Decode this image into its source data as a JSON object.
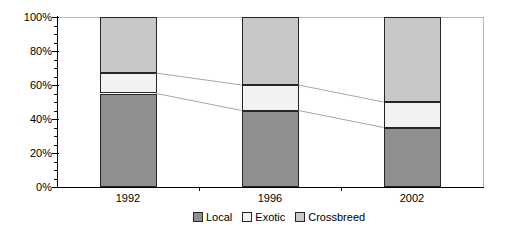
{
  "chart_data": {
    "type": "bar",
    "subtype": "stacked-100-percent",
    "title": "",
    "xlabel": "",
    "ylabel": "",
    "categories": [
      "1992",
      "1996",
      "2002"
    ],
    "series": [
      {
        "name": "Local",
        "values": [
          55,
          45,
          35
        ],
        "color": "#8f8f8f"
      },
      {
        "name": "Exotic",
        "values": [
          12,
          15,
          15
        ],
        "color": "#f2f2f2"
      },
      {
        "name": "Crossbreed",
        "values": [
          33,
          40,
          50
        ],
        "color": "#c8c8c8"
      }
    ],
    "ylim": [
      0,
      100
    ],
    "ytick_labels": [
      "0%",
      "20%",
      "40%",
      "60%",
      "80%",
      "100%"
    ],
    "ymajor_unit": 20,
    "yminor_unit": 5,
    "grid": false,
    "legend_position": "bottom",
    "connector_lines": true
  },
  "style": {
    "background": "#ffffff",
    "axis_color": "#000000",
    "segment_border_color": "#262626",
    "connector_color": "#a6a6a6",
    "plot_border_color": "#b3b3b3"
  }
}
